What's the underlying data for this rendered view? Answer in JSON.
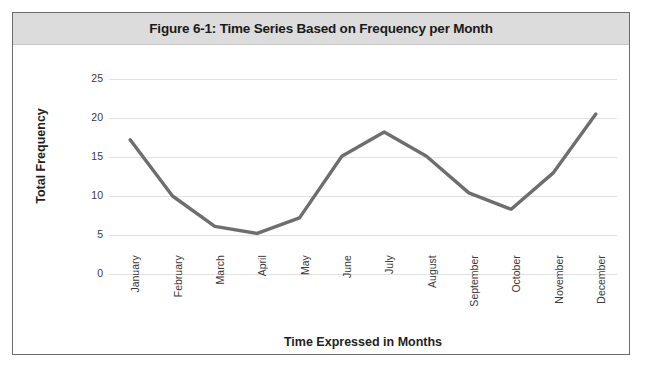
{
  "figure": {
    "title": "Figure 6-1: Time Series Based on Frequency per Month",
    "border_color": "#6b6b6b",
    "title_band_color": "#dcdcdc",
    "background_color": "#ffffff"
  },
  "chart_data": {
    "type": "line",
    "title": "Figure 6-1: Time Series Based on Frequency per Month",
    "xlabel": "Time Expressed in Months",
    "ylabel": "Total Frequency",
    "categories": [
      "January",
      "February",
      "March",
      "April",
      "May",
      "June",
      "July",
      "August",
      "September",
      "October",
      "November",
      "December"
    ],
    "values": [
      17.2,
      10.0,
      6.1,
      5.2,
      7.2,
      15.1,
      18.2,
      15.1,
      10.4,
      8.3,
      13.0,
      20.5
    ],
    "ylim": [
      0,
      25
    ],
    "yticks": [
      0,
      5,
      10,
      15,
      20,
      25
    ],
    "ytick_labels": [
      "0",
      "5",
      "10",
      "15",
      "20",
      "25"
    ],
    "grid": true,
    "grid_axis": "y",
    "legend": false,
    "series": [
      {
        "name": "Total Frequency",
        "color": "#6e6e6e",
        "line_width": 3.4,
        "values": [
          17.2,
          10.0,
          6.1,
          5.2,
          7.2,
          15.1,
          18.2,
          15.1,
          10.4,
          8.3,
          13.0,
          20.5
        ]
      }
    ],
    "colors": {
      "line": "#6e6e6e",
      "grid": "#e2e2e2",
      "tick_text": "#3a3a3a",
      "axis_title_text": "#1f1f1f"
    }
  }
}
